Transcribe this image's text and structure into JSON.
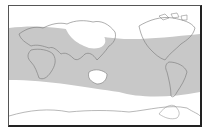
{
  "map": {
    "type": "world-map",
    "projection": "equirectangular-like",
    "center": "pacific",
    "shaded_region": {
      "description": "shaded band across tropics and mid-latitudes",
      "color": "#c8c8c8"
    },
    "land_outline_color": "#777777",
    "background_color": "#ffffff",
    "frame_color": "#222222"
  }
}
